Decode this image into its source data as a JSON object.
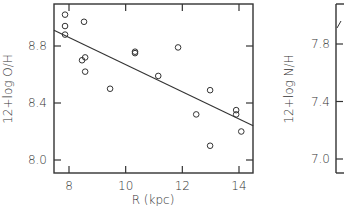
{
  "chart_data": [
    {
      "type": "scatter",
      "panel": "left",
      "title": "",
      "xlabel": "R (kpc)",
      "ylabel": "12+log O/H",
      "xlim": [
        7.45,
        14.55
      ],
      "ylim": [
        7.9,
        9.1
      ],
      "xticks": [
        8,
        10,
        12,
        14
      ],
      "xtick_labels": [
        "8",
        "10",
        "12",
        "14"
      ],
      "yticks": [
        8.0,
        8.4,
        8.8
      ],
      "ytick_labels": [
        "8.0",
        "8.4",
        "8.8"
      ],
      "grid": false,
      "legend": null,
      "series": [
        {
          "name": "HII regions",
          "marker": "open-circle",
          "points": [
            {
              "x": 7.86,
              "y": 9.02
            },
            {
              "x": 7.86,
              "y": 8.94
            },
            {
              "x": 7.86,
              "y": 8.88
            },
            {
              "x": 8.53,
              "y": 8.97
            },
            {
              "x": 8.46,
              "y": 8.7
            },
            {
              "x": 8.57,
              "y": 8.72
            },
            {
              "x": 8.57,
              "y": 8.62
            },
            {
              "x": 9.45,
              "y": 8.5
            },
            {
              "x": 10.33,
              "y": 8.75
            },
            {
              "x": 10.33,
              "y": 8.76
            },
            {
              "x": 11.15,
              "y": 8.59
            },
            {
              "x": 11.85,
              "y": 8.79
            },
            {
              "x": 12.49,
              "y": 8.32
            },
            {
              "x": 12.98,
              "y": 8.49
            },
            {
              "x": 12.98,
              "y": 8.1
            },
            {
              "x": 13.9,
              "y": 8.35
            },
            {
              "x": 13.9,
              "y": 8.32
            },
            {
              "x": 14.08,
              "y": 8.2
            }
          ]
        },
        {
          "name": "linear fit",
          "type": "line",
          "points": [
            {
              "x": 7.47,
              "y": 8.91
            },
            {
              "x": 14.5,
              "y": 8.24
            }
          ]
        }
      ]
    },
    {
      "type": "scatter",
      "panel": "right (partially visible)",
      "xlabel": "",
      "ylabel": "12+log N/H",
      "yticks": [
        7.0,
        7.4,
        7.8
      ],
      "ytick_labels": [
        "7.0",
        "7.4",
        "7.8"
      ],
      "grid": false,
      "series": [
        {
          "name": "linear fit (partial)",
          "type": "line",
          "points": []
        }
      ]
    }
  ],
  "labels": {
    "left_ylabel": "12+log O/H",
    "left_xlabel": "R (kpc)",
    "right_ylabel": "12+log N/H"
  },
  "colors": {
    "ink": "#333333",
    "background": "#ffffff"
  }
}
